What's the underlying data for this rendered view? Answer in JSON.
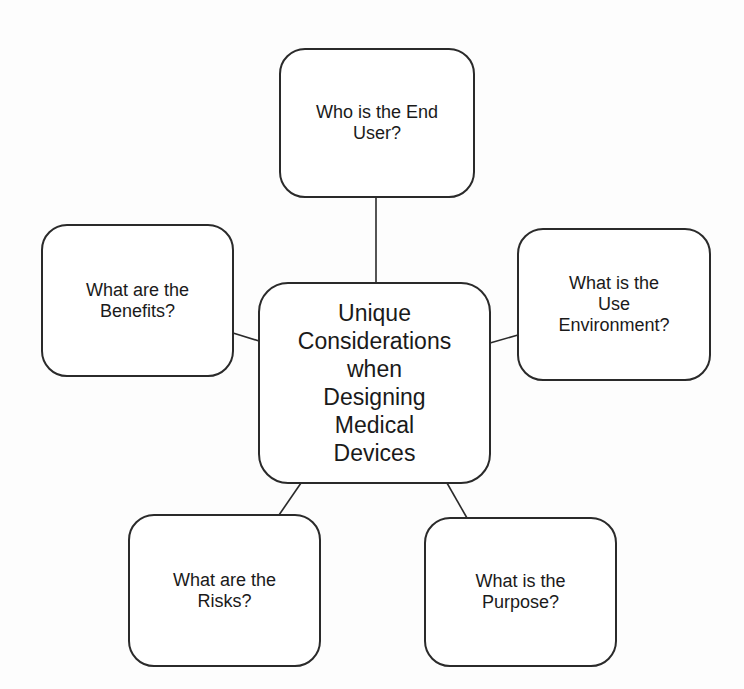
{
  "diagram": {
    "type": "mind-map",
    "central_topic": "Unique\nConsiderations\nwhen\nDesigning\nMedical\nDevices",
    "branches": [
      {
        "id": "top",
        "label": "Who is the End\nUser?"
      },
      {
        "id": "left",
        "label": "What are the\nBenefits?"
      },
      {
        "id": "right",
        "label": "What is the\nUse\nEnvironment?"
      },
      {
        "id": "bottom_left",
        "label": "What are the\nRisks?"
      },
      {
        "id": "bottom_right",
        "label": "What is the\nPurpose?"
      }
    ],
    "colors": {
      "line": "#2a2a2a",
      "box_fill": "#ffffff",
      "text": "#1a1a1a"
    }
  }
}
